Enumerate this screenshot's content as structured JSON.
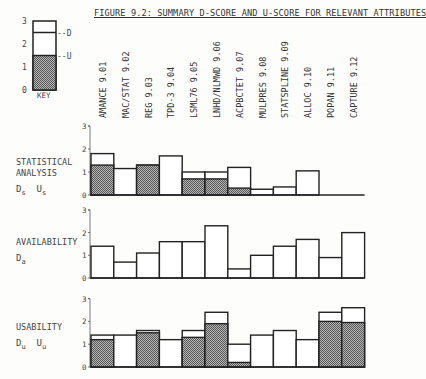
{
  "figure_title": "FIGURE 9.2:  SUMMARY D-SCORE AND U-SCORE FOR RELEVANT ATTRIBUTES",
  "key": {
    "label": "KEY",
    "ticks": [
      "0",
      "1",
      "2",
      "3"
    ],
    "d_label": "--D",
    "u_label": "--U",
    "d_value": 2.5,
    "u_value": 1.5
  },
  "colors": {
    "ink": "#222222",
    "shade": "#888888",
    "background": "#fdfdfb"
  },
  "panels": [
    {
      "label_lines": [
        "STATISTICAL",
        "ANALYSIS"
      ],
      "symbols": "Ds  Us",
      "sym_d": "D",
      "sub_d": "s",
      "sym_u": "U",
      "sub_u": "s"
    },
    {
      "label_lines": [
        "AVAILABILITY"
      ],
      "symbols": "Da",
      "sym_d": "D",
      "sub_d": "a",
      "sym_u": "",
      "sub_u": ""
    },
    {
      "label_lines": [
        "USABILITY"
      ],
      "symbols": "Du  Uu",
      "sym_d": "D",
      "sub_d": "u",
      "sym_u": "U",
      "sub_u": "u"
    }
  ],
  "chart_data": [
    {
      "type": "bar",
      "title": "STATISTICAL ANALYSIS (Ds, Us)",
      "categories": [
        "AMANCE 9.01",
        "MAC/STAT 9.02",
        "REG 9.03",
        "TPD-3 9.04",
        "LSML76 9.05",
        "LNHD/NLMWD 9.06",
        "ACPBCTET 9.07",
        "MULPRES 9.08",
        "STATSPLINE 9.09",
        "ALLOC 9.10",
        "POPAN 9.11",
        "CAPTURE 9.12"
      ],
      "series": [
        {
          "name": "D-score (outline)",
          "values": [
            1.8,
            1.15,
            1.3,
            1.7,
            1.0,
            1.0,
            1.2,
            0.25,
            0.35,
            1.05,
            0,
            0
          ]
        },
        {
          "name": "U-score (shaded)",
          "values": [
            1.3,
            0,
            1.3,
            0,
            0.7,
            0.7,
            0.3,
            0,
            0,
            0,
            0,
            0
          ]
        }
      ],
      "ylabel": "",
      "yticks": [
        0,
        1,
        2,
        3
      ],
      "ylim": [
        0,
        3
      ],
      "grid": false
    },
    {
      "type": "bar",
      "title": "AVAILABILITY (Da)",
      "categories": [
        "AMANCE 9.01",
        "MAC/STAT 9.02",
        "REG 9.03",
        "TPD-3 9.04",
        "LSML76 9.05",
        "LNHD/NLMWD 9.06",
        "ACPBCTET 9.07",
        "MULPRES 9.08",
        "STATSPLINE 9.09",
        "ALLOC 9.10",
        "POPAN 9.11",
        "CAPTURE 9.12"
      ],
      "series": [
        {
          "name": "D-score",
          "values": [
            1.4,
            0.7,
            1.1,
            1.6,
            1.6,
            2.3,
            0.4,
            1.0,
            1.4,
            1.7,
            0.9,
            2.0
          ]
        }
      ],
      "ylabel": "",
      "yticks": [
        0,
        1,
        2,
        3
      ],
      "ylim": [
        0,
        3
      ],
      "grid": false
    },
    {
      "type": "bar",
      "title": "USABILITY (Du, Uu)",
      "categories": [
        "AMANCE 9.01",
        "MAC/STAT 9.02",
        "REG 9.03",
        "TPD-3 9.04",
        "LSML76 9.05",
        "LNHD/NLMWD 9.06",
        "ACPBCTET 9.07",
        "MULPRES 9.08",
        "STATSPLINE 9.09",
        "ALLOC 9.10",
        "POPAN 9.11",
        "CAPTURE 9.12"
      ],
      "series": [
        {
          "name": "D-score (outline)",
          "values": [
            1.4,
            1.4,
            1.6,
            1.2,
            1.6,
            2.4,
            1.0,
            1.4,
            1.6,
            1.2,
            2.4,
            2.6
          ]
        },
        {
          "name": "U-score (shaded)",
          "values": [
            1.2,
            0,
            1.5,
            0,
            1.3,
            1.9,
            0.2,
            0,
            0,
            0,
            2.0,
            1.95
          ]
        }
      ],
      "ylabel": "",
      "yticks": [
        0,
        1,
        2,
        3
      ],
      "ylim": [
        0,
        3
      ],
      "grid": false
    }
  ]
}
